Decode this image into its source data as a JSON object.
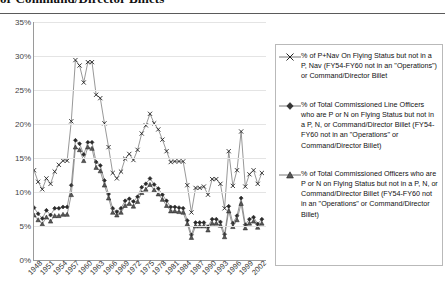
{
  "title": "or Command/Director Billets",
  "legend": {
    "position": "right",
    "entries": [
      {
        "marker": "x-marker",
        "label": "% of P+Nav On Flying Status but not in a P, Nav (FY54-FY60 not in an \"Operations\") or Command/Director Billet"
      },
      {
        "marker": "diamond-marker",
        "label": "% of Total Commissioned Line Officers who are P or N on Flying Status but not in a P, N, or Command/Director Billet (FY54-FY60 not in an \"Operations\" or Command/Director Billet)"
      },
      {
        "marker": "triangle-marker",
        "label": "% of Total Commissioned Officers who are P or N on Flying Status but not in a P, N, or Command/Director Billet (FY54-FY60 not in an \"Operations\" or Command/Director Billet)"
      }
    ]
  },
  "axes": {
    "y_ticks": [
      "0%",
      "5%",
      "10%",
      "15%",
      "20%",
      "25%",
      "30%",
      "35%"
    ],
    "x_ticks": [
      "1948",
      "1951",
      "1954",
      "1957",
      "1960",
      "1963",
      "1966",
      "1969",
      "1972",
      "1975",
      "1978",
      "1981",
      "1984",
      "1987",
      "1990",
      "1993",
      "1996",
      "1999",
      "2002"
    ]
  },
  "chart_data": {
    "type": "line",
    "title": "or Command/Director Billets",
    "xlabel": "",
    "ylabel": "",
    "ylim": [
      0,
      35
    ],
    "xlim": [
      1948,
      2004
    ],
    "grid": true,
    "y_tick_values": [
      0,
      5,
      10,
      15,
      20,
      25,
      30,
      35
    ],
    "x_tick_values": [
      1948,
      1951,
      1954,
      1957,
      1960,
      1963,
      1966,
      1969,
      1972,
      1975,
      1978,
      1981,
      1984,
      1987,
      1990,
      1993,
      1996,
      1999,
      2002
    ],
    "legend_position": "right",
    "x": [
      1948,
      1949,
      1950,
      1951,
      1952,
      1953,
      1954,
      1955,
      1956,
      1957,
      1958,
      1959,
      1960,
      1961,
      1962,
      1963,
      1964,
      1965,
      1966,
      1967,
      1968,
      1969,
      1970,
      1971,
      1972,
      1973,
      1974,
      1975,
      1976,
      1977,
      1978,
      1979,
      1980,
      1981,
      1982,
      1983,
      1984,
      1985,
      1986,
      1987,
      1988,
      1989,
      1990,
      1991,
      1992,
      1993,
      1994,
      1995,
      1996,
      1997,
      1998,
      1999,
      2000,
      2001,
      2002,
      2003
    ],
    "series": [
      {
        "name": "% of P+Nav On Flying Status but not in a P, Nav (FY54-FY60 not in an \"Operations\") or Command/Director Billet",
        "marker": "x",
        "values": [
          13.2,
          11.5,
          10.4,
          12.0,
          11.2,
          13.0,
          14.0,
          14.6,
          14.6,
          20.4,
          29.4,
          28.6,
          26.1,
          29.1,
          29.1,
          24.3,
          23.8,
          20.1,
          16.6,
          12.8,
          12.0,
          13.0,
          14.9,
          15.6,
          14.7,
          16.2,
          18.6,
          19.8,
          21.5,
          20.1,
          19.2,
          17.7,
          16.0,
          14.4,
          14.5,
          14.5,
          14.5,
          11.0,
          7.0,
          10.6,
          10.6,
          10.8,
          9.6,
          11.9,
          11.9,
          11.2,
          7.6,
          16.0,
          10.9,
          13.2,
          18.9,
          10.8,
          12.6,
          13.2,
          11.2,
          12.8
        ]
      },
      {
        "name": "% of Total Commissioned Line Officers who are P or N on Flying Status but not in a P, N, or Command/Director Billet (FY54-FY60 not in an \"Operations\" or Command/Director Billet)",
        "marker": "diamond",
        "values": [
          7.7,
          6.8,
          6.1,
          7.3,
          6.6,
          7.6,
          7.6,
          7.8,
          7.8,
          11.0,
          17.6,
          17.1,
          15.5,
          17.3,
          17.3,
          14.4,
          13.9,
          11.7,
          9.7,
          7.6,
          7.1,
          7.6,
          8.7,
          9.0,
          8.6,
          9.3,
          10.7,
          11.2,
          12.0,
          11.1,
          10.5,
          9.6,
          8.7,
          7.8,
          7.8,
          7.7,
          7.6,
          5.8,
          3.7,
          5.5,
          5.5,
          5.5,
          4.9,
          6.0,
          6.0,
          5.6,
          3.8,
          7.9,
          5.4,
          6.5,
          9.1,
          5.2,
          6.0,
          6.3,
          5.3,
          6.0
        ]
      },
      {
        "name": "% of Total Commissioned Officers who are P or N on Flying Status but not in a P, N, or Command/Director Billet (FY54-FY60 not in an \"Operations\" or Command/Director Billet)",
        "marker": "triangle",
        "values": [
          6.6,
          5.9,
          5.3,
          6.3,
          5.7,
          6.5,
          6.5,
          6.7,
          6.7,
          9.6,
          16.6,
          16.2,
          14.6,
          16.6,
          16.4,
          13.6,
          13.1,
          11.0,
          9.1,
          7.0,
          6.6,
          7.0,
          8.0,
          8.3,
          7.9,
          8.6,
          9.9,
          10.4,
          11.1,
          10.3,
          9.7,
          8.9,
          8.0,
          7.2,
          7.2,
          7.1,
          7.0,
          5.3,
          3.3,
          5.0,
          5.0,
          5.0,
          4.4,
          5.4,
          5.4,
          5.1,
          3.4,
          7.2,
          4.9,
          5.9,
          8.3,
          4.7,
          5.4,
          5.7,
          4.8,
          5.4
        ]
      }
    ]
  }
}
